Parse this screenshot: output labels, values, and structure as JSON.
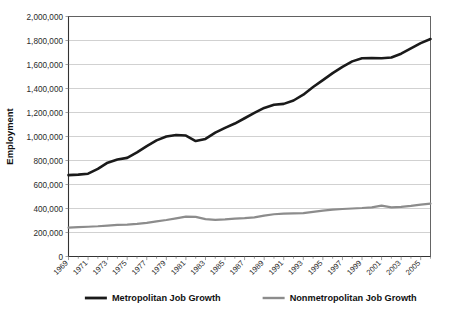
{
  "chart_data": {
    "type": "line",
    "title": "",
    "xlabel": "",
    "ylabel": "Employment",
    "ylim": [
      0,
      2000000
    ],
    "xlim": [
      1969,
      2006
    ],
    "grid": true,
    "legend_position": "bottom",
    "ytick_labels": [
      "0",
      "200,000",
      "400,000",
      "600,000",
      "800,000",
      "1,000,000",
      "1,200,000",
      "1,400,000",
      "1,600,000",
      "1,800,000",
      "2,000,000"
    ],
    "ytick_values": [
      0,
      200000,
      400000,
      600000,
      800000,
      1000000,
      1200000,
      1400000,
      1600000,
      1800000,
      2000000
    ],
    "xtick_labels": [
      "1969",
      "1971",
      "1973",
      "1975",
      "1977",
      "1979",
      "1981",
      "1983",
      "1985",
      "1987",
      "1989",
      "1991",
      "1993",
      "1995",
      "1997",
      "1999",
      "2001",
      "2003",
      "2005"
    ],
    "xtick_values": [
      1969,
      1971,
      1973,
      1975,
      1977,
      1979,
      1981,
      1983,
      1985,
      1987,
      1989,
      1991,
      1993,
      1995,
      1997,
      1999,
      2001,
      2003,
      2005
    ],
    "x": [
      1969,
      1970,
      1971,
      1972,
      1973,
      1974,
      1975,
      1976,
      1977,
      1978,
      1979,
      1980,
      1981,
      1982,
      1983,
      1984,
      1985,
      1986,
      1987,
      1988,
      1989,
      1990,
      1991,
      1992,
      1993,
      1994,
      1995,
      1996,
      1997,
      1998,
      1999,
      2000,
      2001,
      2002,
      2003,
      2004,
      2005,
      2006
    ],
    "series": [
      {
        "name": "Metropolitan Job Growth",
        "color": "#1a1a1a",
        "width": 2.6,
        "values": [
          678000,
          682000,
          690000,
          730000,
          782000,
          808000,
          822000,
          868000,
          920000,
          968000,
          1000000,
          1012000,
          1008000,
          962000,
          980000,
          1032000,
          1072000,
          1108000,
          1152000,
          1196000,
          1238000,
          1264000,
          1272000,
          1300000,
          1348000,
          1412000,
          1470000,
          1528000,
          1580000,
          1626000,
          1652000,
          1654000,
          1652000,
          1658000,
          1690000,
          1734000,
          1778000,
          1812000
        ]
      },
      {
        "name": "Nonmetropolitan Job Growth",
        "color": "#8c8c8c",
        "width": 2.2,
        "values": [
          240000,
          244000,
          248000,
          252000,
          258000,
          264000,
          266000,
          272000,
          280000,
          292000,
          304000,
          318000,
          332000,
          330000,
          312000,
          306000,
          310000,
          316000,
          320000,
          326000,
          340000,
          352000,
          358000,
          360000,
          362000,
          372000,
          382000,
          390000,
          396000,
          400000,
          404000,
          410000,
          424000,
          410000,
          414000,
          422000,
          432000,
          440000
        ]
      }
    ]
  },
  "legend": {
    "items": [
      {
        "label": "Metropolitan Job Growth",
        "color": "#1a1a1a"
      },
      {
        "label": "Nonmetropolitan Job Growth",
        "color": "#8c8c8c"
      }
    ]
  }
}
